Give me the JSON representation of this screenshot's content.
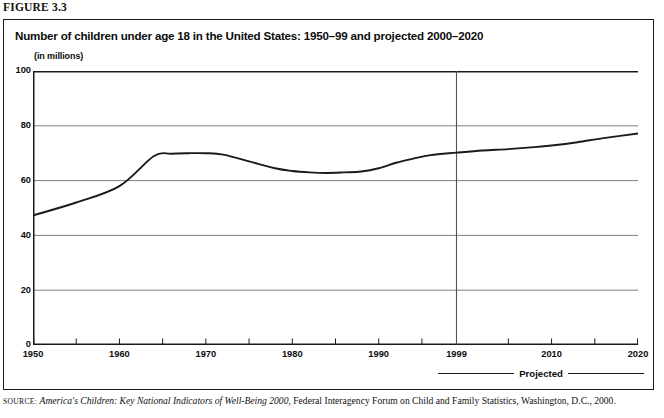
{
  "figure": {
    "label": "FIGURE 3.3"
  },
  "panel": {
    "title": "Number of children under age 18 in the United States: 1950–99 and projected 2000–2020",
    "unit_label": "(in millions)"
  },
  "legend": {
    "label": "Projected"
  },
  "source": {
    "kicker": "SOURCE:",
    "italic_part": "America's Children: Key National Indicators of Well-Being 2000",
    "rest": ", Federal Interagency Forum on Child and Family Statistics, Washington,",
    "line2": "D.C., 2000."
  },
  "colors": {
    "line": "#1a1a1a",
    "grid": "#808080",
    "axis": "#1a1a1a",
    "divider": "#555555",
    "text": "#0d0d0d",
    "background": "#ffffff"
  },
  "chart_data": {
    "type": "line",
    "title": "Number of children under age 18 in the United States: 1950–99 and projected 2000–2020",
    "xlabel": "",
    "ylabel": "(in millions)",
    "xlim": [
      1950,
      2020
    ],
    "ylim": [
      0,
      100
    ],
    "ytick_values": [
      0,
      20,
      40,
      60,
      80,
      100
    ],
    "ytick_labels": [
      "0",
      "20",
      "40",
      "60",
      "80",
      "100"
    ],
    "xtick_values": [
      1950,
      1955,
      1960,
      1965,
      1970,
      1975,
      1980,
      1985,
      1990,
      1995,
      1999,
      2005,
      2010,
      2015,
      2020
    ],
    "xtick_labels_shown": [
      {
        "value": 1950,
        "label": "1950"
      },
      {
        "value": 1960,
        "label": "1960"
      },
      {
        "value": 1970,
        "label": "1970"
      },
      {
        "value": 1980,
        "label": "1980"
      },
      {
        "value": 1990,
        "label": "1990"
      },
      {
        "value": 1999,
        "label": "1999"
      },
      {
        "value": 2010,
        "label": "2010"
      },
      {
        "value": 2020,
        "label": "2020"
      }
    ],
    "grid": "horizontal",
    "legend_position": "below-right",
    "annotations": [
      {
        "type": "vline",
        "x": 1999,
        "label": "Projected",
        "note": "divider between actual and projected data"
      }
    ],
    "series": [
      {
        "name": "Children under age 18 (millions)",
        "x": [
          1950,
          1955,
          1960,
          1964,
          1966,
          1968,
          1970,
          1972,
          1975,
          1978,
          1980,
          1982,
          1984,
          1986,
          1988,
          1990,
          1992,
          1994,
          1996,
          1999,
          2002,
          2005,
          2008,
          2010,
          2013,
          2016,
          2020
        ],
        "values": [
          47.3,
          52.0,
          58.0,
          69.0,
          69.8,
          70.0,
          70.0,
          69.5,
          67.0,
          64.5,
          63.5,
          63.0,
          62.8,
          63.0,
          63.3,
          64.5,
          66.5,
          68.0,
          69.3,
          70.2,
          71.0,
          71.5,
          72.2,
          72.8,
          74.0,
          75.5,
          77.2
        ]
      }
    ]
  }
}
